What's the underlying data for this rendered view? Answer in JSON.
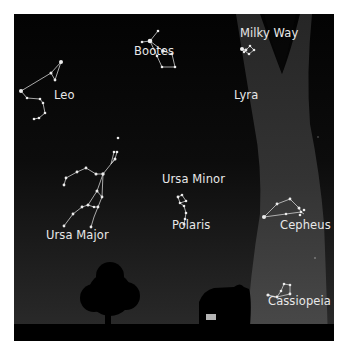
{
  "diagram": {
    "labels": {
      "milky_way": "Milky Way",
      "bootes": "Bootes",
      "leo": "Leo",
      "lyra": "Lyra",
      "ursa_major": "Ursa Major",
      "ursa_minor": "Ursa Minor",
      "polaris": "Polaris",
      "cepheus": "Cepheus",
      "cassiopeia": "Cassiopeia"
    },
    "colors": {
      "sky_top": "#040404",
      "sky_bottom": "#2a2a2a",
      "milky_way": "#3a3a3a",
      "stars": "#e6e6e6",
      "ground": "#000000",
      "window": "#b4b4b4"
    }
  }
}
